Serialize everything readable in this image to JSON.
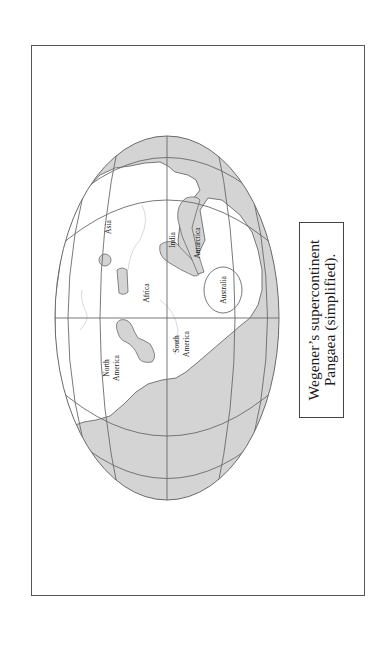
{
  "figure": {
    "caption_lines": [
      "Wegener’s supercontinent",
      "Pangaea (simplified)."
    ],
    "orientation": "rotated 90° counter-clockwise",
    "colors": {
      "ocean": "#d4d4d4",
      "land": "#ffffff",
      "grid": "#6a6a6a",
      "outline": "#6a6a6a",
      "frame": "#555555"
    }
  },
  "map": {
    "labels": {
      "asia": "Asia",
      "africa": "Africa",
      "india": "India",
      "antarctica": "Antarctica",
      "australia": "Australia",
      "north_america_1": "North",
      "north_america_2": "America",
      "south_america_1": "South",
      "south_america_2": "America"
    }
  }
}
